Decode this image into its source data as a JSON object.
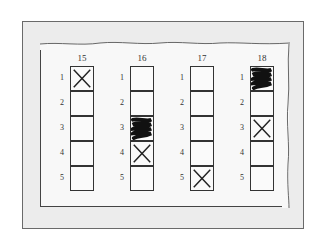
{
  "figure": {
    "columns": [
      {
        "number": "15",
        "rows": [
          {
            "label": "1",
            "mark": "x"
          },
          {
            "label": "2",
            "mark": "none"
          },
          {
            "label": "3",
            "mark": "none"
          },
          {
            "label": "4",
            "mark": "none"
          },
          {
            "label": "5",
            "mark": "none"
          }
        ]
      },
      {
        "number": "16",
        "rows": [
          {
            "label": "1",
            "mark": "none"
          },
          {
            "label": "2",
            "mark": "none"
          },
          {
            "label": "3",
            "mark": "scribble"
          },
          {
            "label": "4",
            "mark": "x"
          },
          {
            "label": "5",
            "mark": "none"
          }
        ]
      },
      {
        "number": "17",
        "rows": [
          {
            "label": "1",
            "mark": "none"
          },
          {
            "label": "2",
            "mark": "none"
          },
          {
            "label": "3",
            "mark": "none"
          },
          {
            "label": "4",
            "mark": "none"
          },
          {
            "label": "5",
            "mark": "x"
          }
        ]
      },
      {
        "number": "18",
        "rows": [
          {
            "label": "1",
            "mark": "scribble"
          },
          {
            "label": "2",
            "mark": "none"
          },
          {
            "label": "3",
            "mark": "x"
          },
          {
            "label": "4",
            "mark": "none"
          },
          {
            "label": "5",
            "mark": "none"
          }
        ]
      }
    ],
    "colors": {
      "outer_bg": "#ececec",
      "paper_bg": "#f8f8f8",
      "ink": "#222222"
    }
  }
}
